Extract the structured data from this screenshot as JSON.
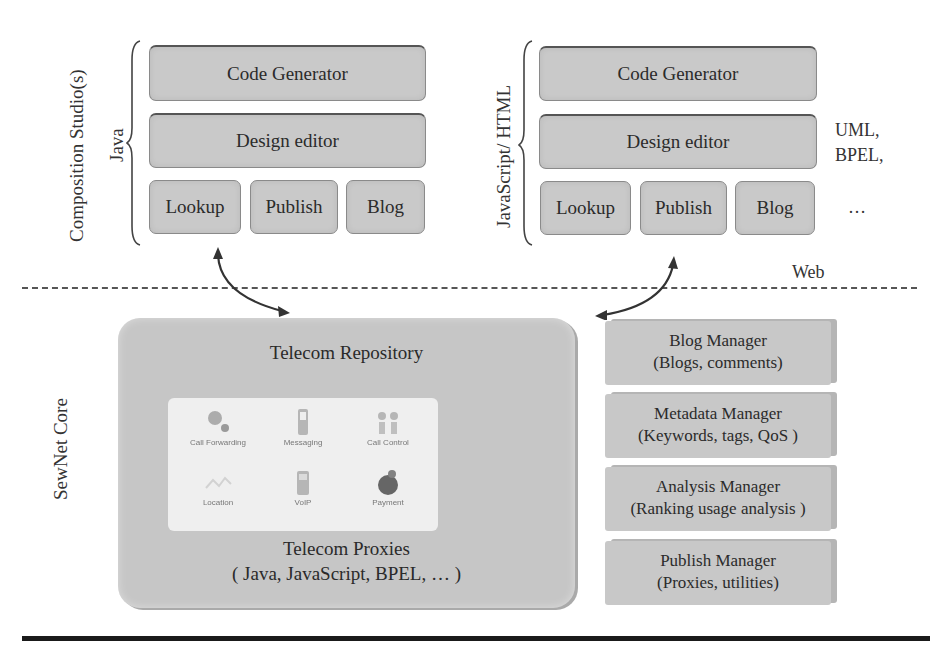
{
  "composition_studios": {
    "label": "Composition Studio(s)",
    "java_stack": {
      "label": "Java",
      "code_generator": "Code Generator",
      "design_editor": "Design editor",
      "modules": [
        "Lookup",
        "Publish",
        "Blog"
      ]
    },
    "js_stack": {
      "label": "JavaScript/ HTML",
      "code_generator": "Code Generator",
      "design_editor": "Design editor",
      "modules": [
        "Lookup",
        "Publish",
        "Blog"
      ],
      "side_note_line1": "UML,",
      "side_note_line2": "BPEL,",
      "ellipsis": "…"
    }
  },
  "web_boundary": {
    "label": "Web"
  },
  "sewnet_core": {
    "label": "SewNet Core",
    "repository": {
      "title": "Telecom Repository",
      "icons": [
        {
          "name": "call-forwarding-icon",
          "label": "Call Forwarding"
        },
        {
          "name": "messaging-icon",
          "label": "Messaging"
        },
        {
          "name": "call-control-icon",
          "label": "Call Control"
        },
        {
          "name": "location-icon",
          "label": "Location"
        },
        {
          "name": "voip-icon",
          "label": "VoIP"
        },
        {
          "name": "payment-icon",
          "label": "Payment"
        }
      ],
      "proxies_title": "Telecom Proxies",
      "proxies_sub": "( Java, JavaScript, BPEL, … )"
    },
    "managers": [
      {
        "title": "Blog Manager",
        "sub": "(Blogs, comments)"
      },
      {
        "title": "Metadata Manager",
        "sub": "(Keywords, tags, QoS )"
      },
      {
        "title": "Analysis Manager",
        "sub": "(Ranking usage analysis )"
      },
      {
        "title": "Publish Manager",
        "sub": "(Proxies, utilities)"
      }
    ]
  }
}
